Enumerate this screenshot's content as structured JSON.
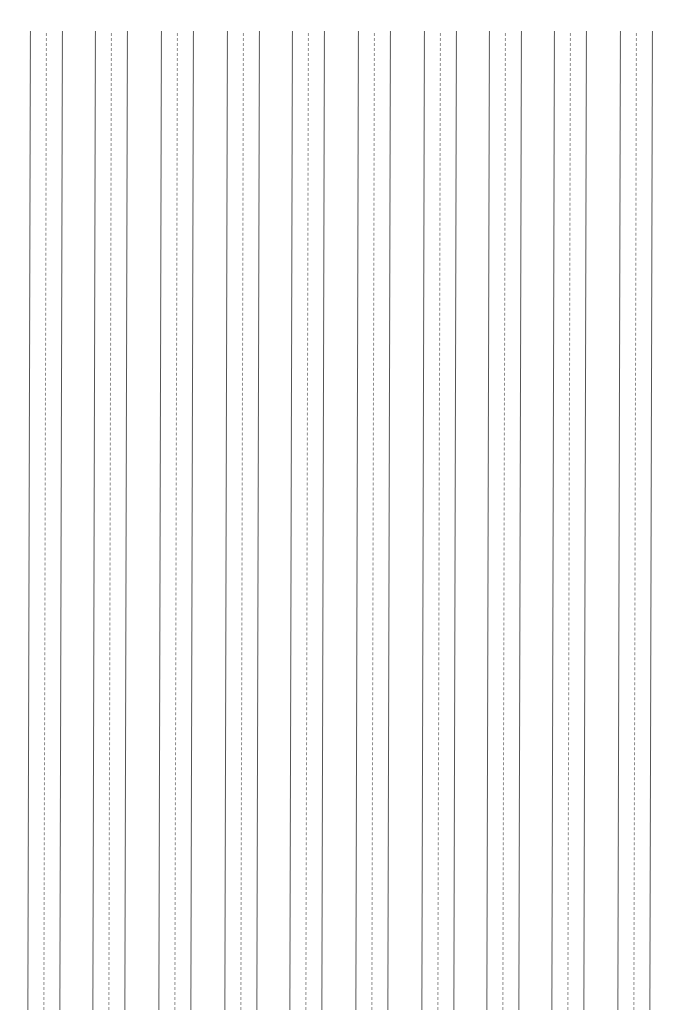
{
  "page": {
    "type": "handwriting-practice-paper",
    "orientation": "vertical-ruling",
    "background": "#ffffff",
    "line_color_solid": "#555555",
    "line_color_dashed": "#8a8a8a"
  },
  "ruling": {
    "group_count": 10,
    "group_left_positions_px": [
      30,
      95,
      161,
      227,
      292,
      358,
      424,
      489,
      554,
      620
    ],
    "group_width_px": 32,
    "lines_per_group": [
      "solid",
      "dashed",
      "solid"
    ],
    "top_px": 31,
    "bottom_px": 1010
  }
}
